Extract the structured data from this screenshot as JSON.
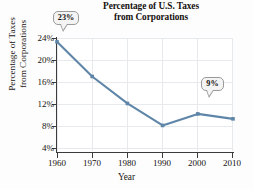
{
  "chart_data": {
    "type": "line",
    "title": "Percentage of U.S. Taxes from Corporations",
    "title_line1": "Percentage of U.S. Taxes",
    "title_line2": "from Corporations",
    "xlabel": "Year",
    "ylabel": "Percentage of Taxes from Corporations",
    "ylabel_line1": "Percentage of Taxes",
    "ylabel_line2": "from Corporations",
    "x": [
      1960,
      1970,
      1980,
      1990,
      2000,
      2010
    ],
    "xtick_labels": [
      "1960",
      "1970",
      "1980",
      "1990",
      "2000",
      "2010"
    ],
    "values": [
      23.3,
      17.0,
      12.1,
      8.1,
      10.2,
      9.3
    ],
    "ytick_values": [
      4,
      8,
      12,
      16,
      20,
      24
    ],
    "ytick_labels": [
      "4%",
      "8%",
      "12%",
      "16%",
      "20%",
      "24%"
    ],
    "xlim": [
      1960,
      2010
    ],
    "ylim": [
      2,
      25
    ],
    "grid": true,
    "legend": "none",
    "line_color": "#5f86a8",
    "grid_color": "#e7eaec",
    "axis_color": "#3b3b3b",
    "background": "#ffffff",
    "annotations": [
      {
        "id": "start",
        "label": "23%",
        "x": 1960,
        "y": 23.3
      },
      {
        "id": "end",
        "label": "9%",
        "x": 2010,
        "y": 9.3
      }
    ]
  }
}
